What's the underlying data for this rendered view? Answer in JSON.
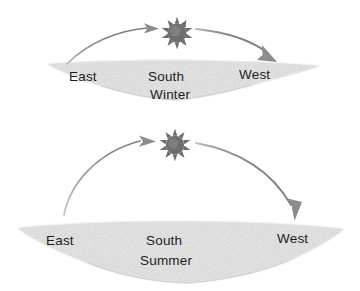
{
  "figure": {
    "background_color": "#ffffff",
    "ground_color": "#c9c9c9",
    "arc_color": "#8a8a8a",
    "sun_color": "#6e6e6e",
    "label_color": "#1d1d1d"
  },
  "panels": [
    {
      "id": "winter",
      "season_label": "Winter",
      "direction_labels": {
        "east": "East",
        "south": "South",
        "west": "West"
      },
      "sun_icon": "sun-icon",
      "arc": {
        "description": "shallow arc",
        "start_direction": "east",
        "end_direction": "west",
        "apex_height_px": 32,
        "span_px": 215
      },
      "arrows": [
        {
          "name": "arrow-rising",
          "direction": "right"
        },
        {
          "name": "arrow-setting",
          "direction": "down-right"
        }
      ]
    },
    {
      "id": "summer",
      "season_label": "Summer",
      "direction_labels": {
        "east": "East",
        "south": "South",
        "west": "West"
      },
      "sun_icon": "sun-icon",
      "arc": {
        "description": "tall arc",
        "start_direction": "east",
        "end_direction": "west",
        "apex_height_px": 92,
        "span_px": 255
      },
      "arrows": [
        {
          "name": "arrow-rising",
          "direction": "right"
        },
        {
          "name": "arrow-setting",
          "direction": "down"
        }
      ]
    }
  ]
}
